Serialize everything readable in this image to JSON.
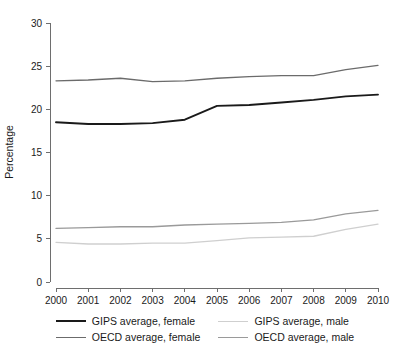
{
  "chart_data": {
    "type": "line",
    "title": "",
    "xlabel": "",
    "ylabel": "Percentage",
    "x": [
      2000,
      2001,
      2002,
      2003,
      2004,
      2005,
      2006,
      2007,
      2008,
      2009,
      2010
    ],
    "categories": [
      "2000",
      "2001",
      "2002",
      "2003",
      "2004",
      "2005",
      "2006",
      "2007",
      "2008",
      "2009",
      "2010"
    ],
    "xlim": [
      2000,
      2010
    ],
    "ylim": [
      0,
      30
    ],
    "y_ticks": [
      0,
      5,
      10,
      15,
      20,
      25,
      30
    ],
    "y_tick_labels": [
      "0",
      "5",
      "10",
      "15",
      "20",
      "25",
      "30"
    ],
    "grid": false,
    "legend_position": "bottom",
    "series": [
      {
        "name": "GIPS average, female",
        "color": "#1a1a1a",
        "width": 1.9,
        "values": [
          18.5,
          18.3,
          18.3,
          18.4,
          18.8,
          20.4,
          20.5,
          20.8,
          21.1,
          21.5,
          21.7
        ]
      },
      {
        "name": "OECD average, female",
        "color": "#6b6b6b",
        "width": 1.3,
        "values": [
          23.3,
          23.4,
          23.6,
          23.2,
          23.3,
          23.6,
          23.8,
          23.9,
          23.9,
          24.6,
          25.1
        ]
      },
      {
        "name": "GIPS average, male",
        "color": "#cfcfcf",
        "width": 1.3,
        "values": [
          4.6,
          4.4,
          4.4,
          4.5,
          4.5,
          4.8,
          5.1,
          5.2,
          5.3,
          6.1,
          6.7
        ]
      },
      {
        "name": "OECD average, male",
        "color": "#9a9a9a",
        "width": 1.3,
        "values": [
          6.2,
          6.3,
          6.4,
          6.4,
          6.6,
          6.7,
          6.8,
          6.9,
          7.2,
          7.9,
          8.3
        ]
      }
    ]
  },
  "legend": {
    "entries": [
      {
        "label": "GIPS average, female",
        "color": "#1a1a1a",
        "width": 2.2
      },
      {
        "label": "GIPS average, male",
        "color": "#cfcfcf",
        "width": 1.5
      },
      {
        "label": "OECD average, female",
        "color": "#6b6b6b",
        "width": 1.5
      },
      {
        "label": "OECD average, male",
        "color": "#9a9a9a",
        "width": 1.5
      }
    ]
  }
}
